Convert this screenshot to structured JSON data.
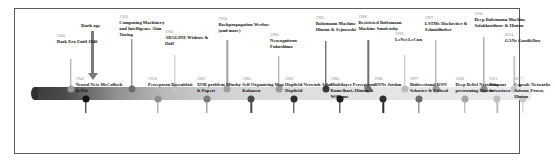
{
  "diagram": {
    "type": "timeline",
    "axis": {
      "orientation": "horizontal",
      "start_shade": "#3d3d3d",
      "end_shade": "#ececec",
      "note": "gradient bar running left (older, dark) to right (newer, light)"
    },
    "annotation": {
      "dark_age_label": "Dark age"
    },
    "events_top": [
      {
        "year": "1940",
        "title": "Dark Era",
        "detail": "Until 1940",
        "dot": "#9a9a9a",
        "x": 7.2,
        "stem_top": 50,
        "label_x": 4.4,
        "label_y": 24,
        "label_w": 9.5
      },
      {
        "year": "1950",
        "title": "Computing Machinery and Intelligence",
        "detail": "Alan Turing",
        "dot": "#6b6b6b",
        "x": 19.5,
        "stem_top": 30,
        "label_x": 17.0,
        "label_y": 5,
        "label_w": 10.5
      },
      {
        "year": "1960",
        "title": "ADALINE",
        "detail": "Widrow & Hoff",
        "dot": "#c3c3c3",
        "x": 28.2,
        "stem_top": 46,
        "label_x": 26.2,
        "label_y": 20,
        "label_w": 10.0
      },
      {
        "year": "1974",
        "title": "Backpropagation",
        "detail": "Werbos (and more)",
        "dot": "#9f9f9f",
        "x": 38.8,
        "stem_top": 31,
        "label_x": 37.0,
        "label_y": 7,
        "label_w": 10.5
      },
      {
        "year": "1980",
        "title": "Neocognitron",
        "detail": "Fukushima",
        "dot": "#9a9a9a",
        "x": 49.2,
        "stem_top": 47,
        "label_x": 47.4,
        "label_y": 23,
        "label_w": 10.0
      },
      {
        "year": "1985",
        "title": "Boltzmann Machine",
        "detail": "Hinton & Sejnowski",
        "dot": "#3a3a3a",
        "x": 58.6,
        "stem_top": 32,
        "label_x": 56.6,
        "label_y": 6,
        "label_w": 9.8
      },
      {
        "year": "1986",
        "title": "Restricted Boltzmann Machine",
        "detail": "Smolensky",
        "dot": "#6f6f6f",
        "x": 67.2,
        "stem_top": 31,
        "label_x": 65.2,
        "label_y": 5,
        "label_w": 10.0
      },
      {
        "year": "1990",
        "title": "LeNet",
        "detail": "LeCun",
        "dot": "#bdbdbd",
        "x": 74.6,
        "stem_top": 46,
        "label_x": 72.6,
        "label_y": 22,
        "label_w": 7.0
      },
      {
        "year": "1997",
        "title": "LSTMs",
        "detail": "Hochreiter & Schmidhuber",
        "dot": "#9a9a9a",
        "x": 80.8,
        "stem_top": 31,
        "label_x": 78.6,
        "label_y": 6,
        "label_w": 11.5
      },
      {
        "year": "2006",
        "title": "Deep Boltzmann Machine",
        "detail": "Salakhutdinov & Hinton",
        "dot": "#8a8a8a",
        "x": 90.5,
        "stem_top": 28,
        "label_x": 88.6,
        "label_y": 2,
        "label_w": 10.5
      },
      {
        "year": "2014",
        "title": "GANs",
        "detail": "Goodfellow",
        "dot": "#c9c9c9",
        "x": 96.6,
        "stem_top": 47,
        "label_x": 94.7,
        "label_y": 23,
        "label_w": 8.5
      }
    ],
    "events_bottom": [
      {
        "year": "1943",
        "title": "Neural Nets",
        "detail": "McCulloch & Pitt",
        "dot": "#111111",
        "x": 10.2,
        "stem_bot": 14,
        "label_x": 8.2,
        "label_y": 67,
        "label_w": 9.5
      },
      {
        "year": "1958",
        "title": "Perceptron",
        "detail": "Rosenblatt",
        "dot": "#8e8e8e",
        "x": 24.8,
        "stem_bot": 14,
        "label_x": 22.8,
        "label_y": 67,
        "label_w": 9.5
      },
      {
        "year": "1969",
        "title": "XOR problem",
        "detail": "Minsky & Papert",
        "dot": "#7a7a7a",
        "x": 34.6,
        "stem_bot": 14,
        "label_x": 32.6,
        "label_y": 67,
        "label_w": 9.5
      },
      {
        "year": "1980",
        "title": "Self Organizing Map",
        "detail": "Kohonen",
        "dot": "#4a4a4a",
        "x": 43.6,
        "stem_bot": 14,
        "label_x": 41.8,
        "label_y": 67,
        "label_w": 9.0
      },
      {
        "year": "1982",
        "title": "Hopfield Network",
        "detail": "John Hopfield",
        "dot": "#2b2b2b",
        "x": 52.2,
        "stem_bot": 14,
        "label_x": 50.4,
        "label_y": 67,
        "label_w": 9.5
      },
      {
        "year": "1986",
        "title": "Multilayer Perceptron",
        "detail": "Rumelhart, Hinton & Williams",
        "dot": "#1c1c1c",
        "x": 61.4,
        "stem_bot": 14,
        "label_x": 59.6,
        "label_y": 67,
        "label_w": 9.5
      },
      {
        "year": "1986",
        "title": "RNNs",
        "detail": "Jordan",
        "dot": "#2e2e2e",
        "x": 70.2,
        "stem_bot": 14,
        "label_x": 68.4,
        "label_y": 67,
        "label_w": 7.5
      },
      {
        "year": "1997",
        "title": "Bidirectional RNN",
        "detail": "Schuster & Paliwal",
        "dot": "#6b6b6b",
        "x": 77.4,
        "stem_bot": 14,
        "label_x": 75.6,
        "label_y": 67,
        "label_w": 10.0
      },
      {
        "year": "2006",
        "title": "Deep Belief Networks pretraining",
        "detail": "Hinton",
        "dot": "#a6a6a6",
        "x": 86.6,
        "stem_bot": 14,
        "label_x": 84.8,
        "label_y": 67,
        "label_w": 9.5
      },
      {
        "year": "2012",
        "title": "Dropout",
        "detail": "Srivastava",
        "dot": "#bdbdbd",
        "x": 93.2,
        "stem_bot": 14,
        "label_x": 91.6,
        "label_y": 67,
        "label_w": 7.5
      },
      {
        "year": "2017",
        "title": "Capsule Networks",
        "detail": "Sabour, Frosst, Hinton",
        "dot": "#c9c9c9",
        "x": 98.4,
        "stem_bot": 14,
        "label_x": 96.6,
        "label_y": 67,
        "label_w": 9.0
      }
    ]
  }
}
